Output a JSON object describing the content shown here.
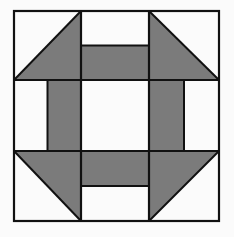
{
  "diagram": {
    "grid": "3x3",
    "colors": {
      "fill_dark": "#7b7b7b",
      "fill_light": "#fbfbfb",
      "stroke": "#111111"
    },
    "pieces": [
      {
        "name": "corner-top-left",
        "type": "half-square-triangle",
        "dark_half": "bottom-right"
      },
      {
        "name": "edge-top",
        "type": "two-bar",
        "dark_half": "bottom"
      },
      {
        "name": "corner-top-right",
        "type": "half-square-triangle",
        "dark_half": "bottom-left"
      },
      {
        "name": "edge-left",
        "type": "two-bar",
        "dark_half": "right"
      },
      {
        "name": "center",
        "type": "plain",
        "dark_half": "none"
      },
      {
        "name": "edge-right",
        "type": "two-bar",
        "dark_half": "left"
      },
      {
        "name": "corner-bottom-left",
        "type": "half-square-triangle",
        "dark_half": "top-right"
      },
      {
        "name": "edge-bottom",
        "type": "two-bar",
        "dark_half": "top"
      },
      {
        "name": "corner-bottom-right",
        "type": "half-square-triangle",
        "dark_half": "top-left"
      }
    ]
  }
}
